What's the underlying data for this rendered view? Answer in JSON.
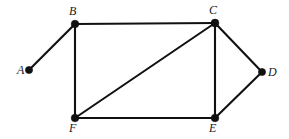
{
  "figure": {
    "kind": "undirected-graph-diagram",
    "background_color": "#ffffff",
    "stroke_color": "#111111",
    "width": 289,
    "height": 139
  },
  "graph": {
    "vertices": [
      {
        "id": "A",
        "label": "A",
        "x": 29,
        "y": 70,
        "label_x": 17,
        "label_y": 64,
        "radius": 3.6
      },
      {
        "id": "B",
        "label": "B",
        "x": 75,
        "y": 24,
        "label_x": 69,
        "label_y": 5,
        "radius": 3.8
      },
      {
        "id": "C",
        "label": "C",
        "x": 215,
        "y": 23,
        "label_x": 209,
        "label_y": 4,
        "radius": 3.9
      },
      {
        "id": "D",
        "label": "D",
        "x": 262,
        "y": 72,
        "label_x": 268,
        "label_y": 66,
        "radius": 3.6
      },
      {
        "id": "E",
        "label": "E",
        "x": 215,
        "y": 118,
        "label_x": 209,
        "label_y": 122,
        "radius": 3.8
      },
      {
        "id": "F",
        "label": "F",
        "x": 75,
        "y": 118,
        "label_x": 69,
        "label_y": 122,
        "radius": 3.8
      }
    ],
    "edges": [
      {
        "id": "A-B",
        "from": "A",
        "to": "B",
        "x1": 29,
        "y1": 70,
        "x2": 75,
        "y2": 24
      },
      {
        "id": "B-C",
        "from": "B",
        "to": "C",
        "x1": 75,
        "y1": 24,
        "x2": 215,
        "y2": 23
      },
      {
        "id": "B-F",
        "from": "B",
        "to": "F",
        "x1": 75,
        "y1": 24,
        "x2": 75,
        "y2": 118
      },
      {
        "id": "C-F",
        "from": "C",
        "to": "F",
        "x1": 215,
        "y1": 23,
        "x2": 75,
        "y2": 118
      },
      {
        "id": "C-E",
        "from": "C",
        "to": "E",
        "x1": 215,
        "y1": 23,
        "x2": 215,
        "y2": 118
      },
      {
        "id": "C-D",
        "from": "C",
        "to": "D",
        "x1": 215,
        "y1": 23,
        "x2": 262,
        "y2": 72
      },
      {
        "id": "D-E",
        "from": "D",
        "to": "E",
        "x1": 262,
        "y1": 72,
        "x2": 215,
        "y2": 118
      },
      {
        "id": "F-E",
        "from": "F",
        "to": "E",
        "x1": 75,
        "y1": 118,
        "x2": 215,
        "y2": 118
      }
    ]
  }
}
